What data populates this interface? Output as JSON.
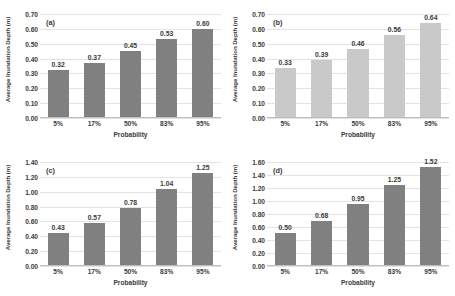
{
  "figure": {
    "background_color": "#ffffff",
    "bar_color_dark": "#808080",
    "bar_color_light": "#c9c9c9",
    "gridline_color": "#e3e3e3"
  },
  "chart_data": [
    {
      "type": "bar",
      "panel": "(a)",
      "title": "",
      "xlabel": "Probability",
      "ylabel": "Average Inundation Depth (m)",
      "categories": [
        "5%",
        "17%",
        "50%",
        "83%",
        "95%"
      ],
      "values": [
        0.32,
        0.37,
        0.45,
        0.53,
        0.6
      ],
      "value_labels": [
        "0.32",
        "0.37",
        "0.45",
        "0.53",
        "0.60"
      ],
      "ylim": [
        0.0,
        0.7
      ],
      "ytick_step": 0.1,
      "ytick_labels": [
        "0.70",
        "0.60",
        "0.50",
        "0.40",
        "0.30",
        "0.20",
        "0.10",
        "0.00"
      ],
      "bar_color": "#808080",
      "grid": true,
      "legend": "none"
    },
    {
      "type": "bar",
      "panel": "(b)",
      "title": "",
      "xlabel": "Probability",
      "ylabel": "Average Inundation Depth (m)",
      "categories": [
        "5%",
        "17%",
        "50%",
        "83%",
        "95%"
      ],
      "values": [
        0.33,
        0.39,
        0.46,
        0.56,
        0.64
      ],
      "value_labels": [
        "0.33",
        "0.39",
        "0.46",
        "0.56",
        "0.64"
      ],
      "ylim": [
        0.0,
        0.7
      ],
      "ytick_step": 0.1,
      "ytick_labels": [
        "0.70",
        "0.60",
        "0.50",
        "0.40",
        "0.30",
        "0.20",
        "0.10",
        "0.00"
      ],
      "bar_color": "#c9c9c9",
      "grid": true,
      "legend": "none"
    },
    {
      "type": "bar",
      "panel": "(c)",
      "title": "",
      "xlabel": "Probability",
      "ylabel": "Average Inundation Depth (m)",
      "categories": [
        "5%",
        "17%",
        "50%",
        "83%",
        "95%"
      ],
      "values": [
        0.43,
        0.57,
        0.78,
        1.04,
        1.25
      ],
      "value_labels": [
        "0.43",
        "0.57",
        "0.78",
        "1.04",
        "1.25"
      ],
      "ylim": [
        0.0,
        1.4
      ],
      "ytick_step": 0.2,
      "ytick_labels": [
        "1.40",
        "1.20",
        "1.00",
        "0.80",
        "0.60",
        "0.40",
        "0.20",
        "0.00"
      ],
      "bar_color": "#808080",
      "grid": true,
      "legend": "none"
    },
    {
      "type": "bar",
      "panel": "(d)",
      "title": "",
      "xlabel": "Probability",
      "ylabel": "Average Inundation Depth (m)",
      "categories": [
        "5%",
        "17%",
        "50%",
        "83%",
        "95%"
      ],
      "values": [
        0.5,
        0.68,
        0.95,
        1.25,
        1.52
      ],
      "value_labels": [
        "0.50",
        "0.68",
        "0.95",
        "1.25",
        "1.52"
      ],
      "ylim": [
        0.0,
        1.6
      ],
      "ytick_step": 0.2,
      "ytick_labels": [
        "1.60",
        "1.40",
        "1.20",
        "1.00",
        "0.80",
        "0.60",
        "0.40",
        "0.20",
        "0.00"
      ],
      "bar_color": "#808080",
      "grid": true,
      "legend": "none"
    }
  ]
}
